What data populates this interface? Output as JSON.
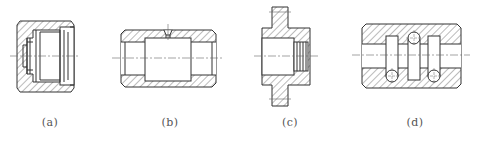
{
  "figure": {
    "panels": [
      {
        "id": "a",
        "label": "(a)",
        "description": "Cross-section with stepped bore, internal grooves and chamfered ends"
      },
      {
        "id": "b",
        "label": "(b)",
        "description": "Cross-section of sleeve with central recess and radial hole"
      },
      {
        "id": "c",
        "label": "(c)",
        "description": "Flanged bushing cross-section with internal thread"
      },
      {
        "id": "d",
        "label": "(d)",
        "description": "Block with bore, two annular grooves and three circular passages"
      }
    ],
    "colors": {
      "line": "#333333",
      "hatch": "#555555",
      "center": "#666666"
    }
  }
}
